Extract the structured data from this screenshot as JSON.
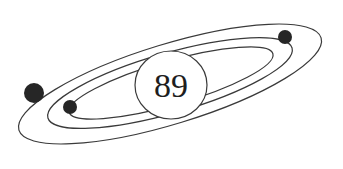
{
  "diagram": {
    "type": "atom-orbit-illustration",
    "nucleus": {
      "label": "89"
    },
    "orbits": [
      {
        "name": "outer-orbit"
      },
      {
        "name": "middle-orbit"
      },
      {
        "name": "inner-orbit"
      }
    ],
    "electrons": [
      {
        "name": "electron-outer-left"
      },
      {
        "name": "electron-middle-right"
      },
      {
        "name": "electron-inner-left"
      }
    ],
    "colors": {
      "stroke": "#3a3a3a",
      "electron": "#262626",
      "background": "#ffffff"
    }
  }
}
